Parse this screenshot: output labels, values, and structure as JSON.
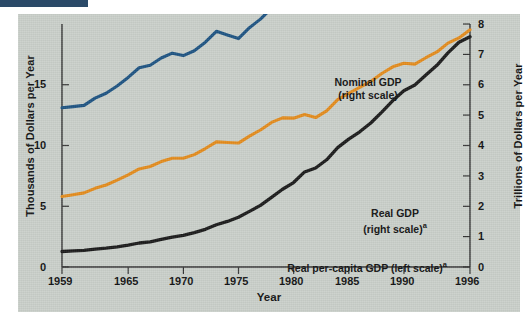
{
  "axes": {
    "left_title": "Thousands of Dollars per Year",
    "right_title": "Trillions of Dollars per Year",
    "x_title": "Year",
    "left_ticks": [
      "0",
      "5",
      "10",
      "15"
    ],
    "right_ticks": [
      "0",
      "1",
      "2",
      "3",
      "4",
      "5",
      "6",
      "7",
      "8"
    ],
    "x_ticks": [
      "1959",
      "1965",
      "1970",
      "1975",
      "1980",
      "1985",
      "1990",
      "1996"
    ]
  },
  "annotations": {
    "nominal_line1": "Nominal GDP",
    "nominal_line2": "(right scale)",
    "real_line1": "Real GDP",
    "real_line2": "(right scale)",
    "real_sup": "a",
    "percap": "Real per-capita GDP (left scale)",
    "percap_sup": "a"
  },
  "colors": {
    "nominal": "#1a1a1a",
    "real": "#e38b1c",
    "per_capita": "#1d5382",
    "panel": "#c9cfc9",
    "accent_bar": "#2b4a68"
  },
  "chart_data": {
    "type": "line",
    "title": "",
    "xlabel": "Year",
    "ylabel": "Thousands of Dollars per Year",
    "ylabel_right": "Trillions of Dollars per Year",
    "xlim": [
      1959,
      1996
    ],
    "ylim_left": [
      0,
      20
    ],
    "ylim_right": [
      0,
      8
    ],
    "grid": false,
    "legend": "annotations-on-plot",
    "x": [
      1959,
      1960,
      1961,
      1962,
      1963,
      1964,
      1965,
      1966,
      1967,
      1968,
      1969,
      1970,
      1971,
      1972,
      1973,
      1974,
      1975,
      1976,
      1977,
      1978,
      1979,
      1980,
      1981,
      1982,
      1983,
      1984,
      1985,
      1986,
      1987,
      1988,
      1989,
      1990,
      1991,
      1992,
      1993,
      1994,
      1995,
      1996
    ],
    "series": [
      {
        "name": "Nominal GDP (right scale)",
        "axis": "right",
        "unit": "trillions of dollars per year",
        "color": "#1a1a1a",
        "values": [
          0.51,
          0.53,
          0.55,
          0.59,
          0.62,
          0.66,
          0.72,
          0.79,
          0.83,
          0.91,
          0.98,
          1.04,
          1.13,
          1.24,
          1.39,
          1.5,
          1.64,
          1.83,
          2.03,
          2.29,
          2.56,
          2.78,
          3.13,
          3.26,
          3.53,
          3.93,
          4.21,
          4.45,
          4.74,
          5.1,
          5.48,
          5.8,
          5.99,
          6.32,
          6.64,
          7.05,
          7.4,
          7.58
        ]
      },
      {
        "name": "Real GDP (right scale)",
        "axis": "right",
        "unit": "trillions of 1992 dollars per year",
        "color": "#e38b1c",
        "values": [
          2.32,
          2.38,
          2.44,
          2.59,
          2.7,
          2.86,
          3.03,
          3.23,
          3.31,
          3.47,
          3.58,
          3.58,
          3.7,
          3.9,
          4.12,
          4.1,
          4.08,
          4.31,
          4.51,
          4.76,
          4.91,
          4.9,
          5.02,
          4.92,
          5.14,
          5.51,
          5.72,
          5.91,
          6.11,
          6.37,
          6.59,
          6.71,
          6.68,
          6.89,
          7.08,
          7.37,
          7.54,
          7.81
        ]
      },
      {
        "name": "Real per-capita GDP (left scale)",
        "axis": "left",
        "unit": "thousands of 1992 dollars per year",
        "color": "#1d5382",
        "values": [
          13.1,
          13.2,
          13.3,
          13.9,
          14.3,
          14.9,
          15.6,
          16.4,
          16.6,
          17.2,
          17.6,
          17.4,
          17.8,
          18.5,
          19.4,
          19.1,
          18.8,
          19.7,
          20.4,
          21.3,
          21.7,
          21.5,
          21.8,
          21.1,
          21.9,
          23.2,
          23.9,
          24.5,
          25.1,
          25.9,
          26.6,
          26.8,
          26.4,
          26.9,
          27.4,
          28.3,
          28.7,
          29.4
        ]
      }
    ]
  }
}
